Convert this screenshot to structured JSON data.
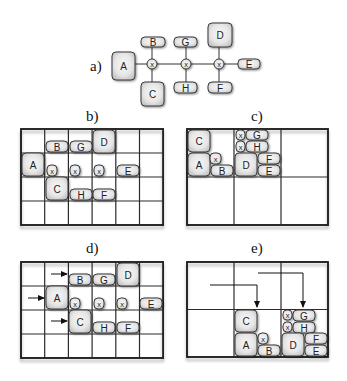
{
  "figure": {
    "panels": [
      {
        "id": "a",
        "label": "a)",
        "label_pos": [
          90,
          71
        ],
        "type": "graph",
        "nodes": [
          {
            "label": "A",
            "kind": "box",
            "x": 112,
            "y": 52,
            "w": 23,
            "h": 28
          },
          {
            "label": "B",
            "kind": "box",
            "x": 141,
            "y": 37,
            "w": 24,
            "h": 10
          },
          {
            "label": "C",
            "kind": "box",
            "x": 141,
            "y": 82,
            "w": 23,
            "h": 24
          },
          {
            "label": "G",
            "kind": "box",
            "x": 174,
            "y": 37,
            "w": 23,
            "h": 10
          },
          {
            "label": "H",
            "kind": "box",
            "x": 174,
            "y": 82,
            "w": 23,
            "h": 11
          },
          {
            "label": "D",
            "kind": "box",
            "x": 208,
            "y": 23,
            "w": 24,
            "h": 24
          },
          {
            "label": "F",
            "kind": "box",
            "x": 208,
            "y": 82,
            "w": 24,
            "h": 11
          },
          {
            "label": "E",
            "kind": "box",
            "x": 238,
            "y": 59,
            "w": 22,
            "h": 10
          },
          {
            "label": "x",
            "kind": "circle",
            "cx": 152,
            "cy": 64,
            "r": 5
          },
          {
            "label": "x",
            "kind": "circle",
            "cx": 186,
            "cy": 64,
            "r": 5
          },
          {
            "label": "x",
            "kind": "circle",
            "cx": 219,
            "cy": 64,
            "r": 5
          }
        ],
        "edges": [
          [
            135,
            64,
            147,
            64
          ],
          [
            157,
            64,
            181,
            64
          ],
          [
            191,
            64,
            214,
            64
          ],
          [
            224,
            64,
            238,
            64
          ],
          [
            152,
            47,
            152,
            59
          ],
          [
            152,
            69,
            152,
            82
          ],
          [
            186,
            47,
            186,
            59
          ],
          [
            186,
            69,
            186,
            82
          ],
          [
            219,
            47,
            219,
            59
          ],
          [
            219,
            69,
            219,
            82
          ]
        ]
      },
      {
        "id": "b",
        "label": "b)",
        "label_pos": [
          86,
          121
        ],
        "type": "grid",
        "grid": {
          "x": 21,
          "y": 129,
          "cols": 6,
          "rows": 4,
          "cw": 23.7,
          "ch": 24
        },
        "nodes": [
          {
            "label": "B",
            "kind": "box",
            "x": 46,
            "y": 141,
            "w": 22,
            "h": 11
          },
          {
            "label": "G",
            "kind": "box",
            "x": 70,
            "y": 141,
            "w": 22,
            "h": 11
          },
          {
            "label": "D",
            "kind": "box",
            "x": 93,
            "y": 130,
            "w": 22,
            "h": 23
          },
          {
            "label": "A",
            "kind": "box",
            "x": 22,
            "y": 153,
            "w": 22,
            "h": 23
          },
          {
            "label": "x",
            "kind": "xbox",
            "x": 47,
            "y": 165,
            "w": 10,
            "h": 11
          },
          {
            "label": "x",
            "kind": "xbox",
            "x": 70,
            "y": 165,
            "w": 10,
            "h": 11
          },
          {
            "label": "x",
            "kind": "xbox",
            "x": 94,
            "y": 165,
            "w": 10,
            "h": 11
          },
          {
            "label": "E",
            "kind": "box",
            "x": 117,
            "y": 165,
            "w": 22,
            "h": 11
          },
          {
            "label": "C",
            "kind": "box",
            "x": 46,
            "y": 177,
            "w": 22,
            "h": 23
          },
          {
            "label": "H",
            "kind": "box",
            "x": 70,
            "y": 189,
            "w": 22,
            "h": 11
          },
          {
            "label": "F",
            "kind": "box",
            "x": 93,
            "y": 189,
            "w": 22,
            "h": 11
          }
        ],
        "arrows": []
      },
      {
        "id": "c",
        "label": "c)",
        "label_pos": [
          251,
          121
        ],
        "type": "grid",
        "grid": {
          "x": 187,
          "y": 129,
          "cols": 3,
          "rows": 2,
          "cw": 47,
          "ch": 48
        },
        "nodes": [
          {
            "label": "C",
            "kind": "box",
            "x": 188,
            "y": 130,
            "w": 22,
            "h": 22
          },
          {
            "label": "A",
            "kind": "box",
            "x": 188,
            "y": 153,
            "w": 22,
            "h": 23
          },
          {
            "label": "x",
            "kind": "xbox",
            "x": 210,
            "y": 153,
            "w": 11,
            "h": 11
          },
          {
            "label": "B",
            "kind": "box",
            "x": 211,
            "y": 165,
            "w": 22,
            "h": 11
          },
          {
            "label": "x",
            "kind": "xbox",
            "x": 236,
            "y": 130,
            "w": 9,
            "h": 10
          },
          {
            "label": "G",
            "kind": "box",
            "x": 246,
            "y": 130,
            "w": 22,
            "h": 10
          },
          {
            "label": "x",
            "kind": "xbox",
            "x": 236,
            "y": 141,
            "w": 9,
            "h": 11
          },
          {
            "label": "H",
            "kind": "box",
            "x": 246,
            "y": 141,
            "w": 22,
            "h": 11
          },
          {
            "label": "D",
            "kind": "box",
            "x": 235,
            "y": 153,
            "w": 22,
            "h": 23
          },
          {
            "label": "F",
            "kind": "box",
            "x": 258,
            "y": 153,
            "w": 22,
            "h": 11
          },
          {
            "label": "E",
            "kind": "box",
            "x": 258,
            "y": 165,
            "w": 22,
            "h": 11
          }
        ],
        "arrows": []
      },
      {
        "id": "d",
        "label": "d)",
        "label_pos": [
          86,
          253
        ],
        "type": "grid",
        "grid": {
          "x": 21,
          "y": 262,
          "cols": 6,
          "rows": 4,
          "cw": 23.7,
          "ch": 24
        },
        "nodes": [
          {
            "label": "B",
            "kind": "box",
            "x": 69,
            "y": 274,
            "w": 22,
            "h": 11
          },
          {
            "label": "G",
            "kind": "box",
            "x": 93,
            "y": 274,
            "w": 22,
            "h": 11
          },
          {
            "label": "D",
            "kind": "box",
            "x": 117,
            "y": 263,
            "w": 22,
            "h": 23
          },
          {
            "label": "A",
            "kind": "box",
            "x": 46,
            "y": 286,
            "w": 22,
            "h": 23
          },
          {
            "label": "x",
            "kind": "xbox",
            "x": 70,
            "y": 298,
            "w": 10,
            "h": 11
          },
          {
            "label": "x",
            "kind": "xbox",
            "x": 94,
            "y": 298,
            "w": 10,
            "h": 11
          },
          {
            "label": "x",
            "kind": "xbox",
            "x": 117,
            "y": 298,
            "w": 10,
            "h": 11
          },
          {
            "label": "E",
            "kind": "box",
            "x": 140,
            "y": 298,
            "w": 22,
            "h": 11
          },
          {
            "label": "C",
            "kind": "box",
            "x": 69,
            "y": 310,
            "w": 22,
            "h": 23
          },
          {
            "label": "H",
            "kind": "box",
            "x": 93,
            "y": 322,
            "w": 22,
            "h": 11
          },
          {
            "label": "F",
            "kind": "box",
            "x": 117,
            "y": 322,
            "w": 22,
            "h": 11
          }
        ],
        "arrows": [
          {
            "points": [
              [
                51,
                274
              ],
              [
                67,
                274
              ]
            ]
          },
          {
            "points": [
              [
                28,
                298
              ],
              [
                44,
                298
              ]
            ]
          },
          {
            "points": [
              [
                51,
                321
              ],
              [
                67,
                321
              ]
            ]
          }
        ]
      },
      {
        "id": "e",
        "label": "e)",
        "label_pos": [
          251,
          253
        ],
        "type": "grid",
        "grid": {
          "x": 187,
          "y": 262,
          "cols": 3,
          "rows": 2,
          "cw": 47,
          "ch": 47.5
        },
        "nodes": [
          {
            "label": "C",
            "kind": "box",
            "x": 235,
            "y": 310,
            "w": 22,
            "h": 22
          },
          {
            "label": "A",
            "kind": "box",
            "x": 235,
            "y": 333,
            "w": 22,
            "h": 23
          },
          {
            "label": "x",
            "kind": "xbox",
            "x": 258,
            "y": 333,
            "w": 10,
            "h": 11
          },
          {
            "label": "B",
            "kind": "box",
            "x": 258,
            "y": 345,
            "w": 22,
            "h": 11
          },
          {
            "label": "x",
            "kind": "xbox",
            "x": 283,
            "y": 310,
            "w": 9,
            "h": 10
          },
          {
            "label": "G",
            "kind": "box",
            "x": 293,
            "y": 310,
            "w": 22,
            "h": 11
          },
          {
            "label": "x",
            "kind": "xbox",
            "x": 283,
            "y": 322,
            "w": 9,
            "h": 10
          },
          {
            "label": "H",
            "kind": "box",
            "x": 293,
            "y": 322,
            "w": 22,
            "h": 11
          },
          {
            "label": "D",
            "kind": "box",
            "x": 282,
            "y": 333,
            "w": 22,
            "h": 23
          },
          {
            "label": "F",
            "kind": "box",
            "x": 305,
            "y": 333,
            "w": 22,
            "h": 11
          },
          {
            "label": "E",
            "kind": "box",
            "x": 305,
            "y": 345,
            "w": 22,
            "h": 11
          }
        ],
        "arrows": [
          {
            "points": [
              [
                210,
                285
              ],
              [
                257,
                285
              ],
              [
                257,
                307
              ]
            ]
          },
          {
            "points": [
              [
                258,
                273
              ],
              [
                303,
                273
              ],
              [
                303,
                307
              ]
            ]
          }
        ]
      }
    ]
  }
}
